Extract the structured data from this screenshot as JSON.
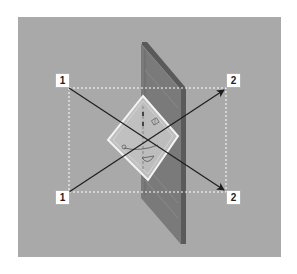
{
  "figure": {
    "type": "instructional-diagram",
    "colors": {
      "page_background": "#ffffff",
      "scene_background": "#a9a9a9",
      "door_panel_face": "#7c7c7c",
      "door_panel_side": "#5e5e5e",
      "bracket_panel": "#c4c4c4",
      "bracket_border": "#f2f2f2",
      "dashed_guide": "#ffffff",
      "arrow": "#1e1e1e",
      "label_bg": "#ffffff",
      "label_text": "#222222"
    }
  },
  "labels": {
    "top_left": "1",
    "bottom_left": "1",
    "top_right": "2",
    "bottom_right": "2"
  },
  "arrows": [
    {
      "from": "top_left",
      "to": "bottom_right",
      "label_from": "1",
      "label_to": "2"
    },
    {
      "from": "bottom_left",
      "to": "top_right",
      "label_from": "1",
      "label_to": "2"
    }
  ],
  "icons": {
    "bracket_mark_top": "grid-square-symbol",
    "bracket_mark_left": "small-circle-symbol",
    "bracket_mark_bottom": "rotation-arc-symbol"
  }
}
